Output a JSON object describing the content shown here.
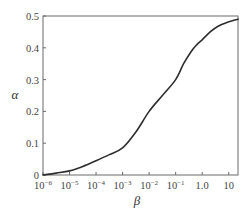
{
  "chart_data": {
    "type": "line",
    "title": "",
    "xlabel": "β",
    "ylabel": "α",
    "xscale": "log",
    "xlim_log10": [
      -6,
      1.35
    ],
    "ylim": [
      0,
      0.5
    ],
    "grid": false,
    "legend": null,
    "x_ticks": [
      {
        "log10": -6,
        "base": "10",
        "exp": "−6"
      },
      {
        "log10": -5,
        "base": "10",
        "exp": "−5"
      },
      {
        "log10": -4,
        "base": "10",
        "exp": "−4"
      },
      {
        "log10": -3,
        "base": "10",
        "exp": "−3"
      },
      {
        "log10": -2,
        "base": "10",
        "exp": "−2"
      },
      {
        "log10": -1,
        "base": "10",
        "exp": "−1"
      },
      {
        "log10": 0,
        "base": "1.0",
        "exp": ""
      },
      {
        "log10": 1,
        "base": "10",
        "exp": ""
      }
    ],
    "y_ticks": [
      {
        "value": 0,
        "label": "0"
      },
      {
        "value": 0.1,
        "label": "0.1"
      },
      {
        "value": 0.2,
        "label": "0.2"
      },
      {
        "value": 0.3,
        "label": "0.3"
      },
      {
        "value": 0.4,
        "label": "0.4"
      },
      {
        "value": 0.5,
        "label": "0.5"
      }
    ],
    "series": [
      {
        "name": "alpha-vs-beta",
        "color": "#2e2e2e",
        "points_log10x": [
          [
            -6.0,
            0.0
          ],
          [
            -5.5,
            0.006
          ],
          [
            -5.0,
            0.013
          ],
          [
            -4.5,
            0.027
          ],
          [
            -4.0,
            0.045
          ],
          [
            -3.5,
            0.064
          ],
          [
            -3.0,
            0.085
          ],
          [
            -2.5,
            0.135
          ],
          [
            -2.0,
            0.2
          ],
          [
            -1.5,
            0.25
          ],
          [
            -1.0,
            0.3
          ],
          [
            -0.7,
            0.35
          ],
          [
            -0.4,
            0.39
          ],
          [
            -0.2,
            0.41
          ],
          [
            0.0,
            0.425
          ],
          [
            0.3,
            0.45
          ],
          [
            0.6,
            0.468
          ],
          [
            0.95,
            0.48
          ],
          [
            1.35,
            0.49
          ]
        ]
      }
    ]
  }
}
